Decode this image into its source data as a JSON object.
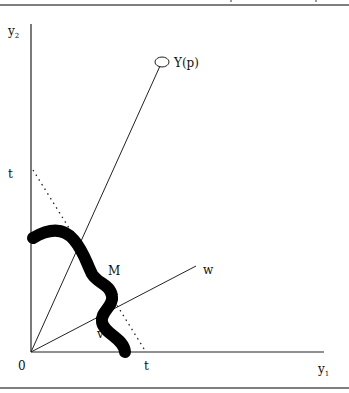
{
  "figure": {
    "type": "economic-diagram",
    "axes": {
      "x_label": "y",
      "x_subscript": "1",
      "y_label": "y",
      "y_subscript": "2",
      "origin_label": "0"
    },
    "intercepts": {
      "x_intercept_label": "t",
      "y_intercept_label": "t"
    },
    "points": {
      "production_point_label": "Y(p)"
    },
    "rays": {
      "w_label": "w"
    },
    "regions": {
      "M_label": "M",
      "v_label": "v"
    },
    "colors": {
      "ink": "#111111",
      "background": "#ffffff",
      "rule": "#555555"
    }
  }
}
